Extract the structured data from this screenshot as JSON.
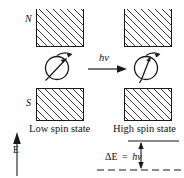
{
  "figure": {
    "stroke_color": "#1a1a1a",
    "hatch_color": "#3a3a3a",
    "background": "#ffffff"
  },
  "labels": {
    "north_pole": "N",
    "south_pole": "S",
    "photon": "hν",
    "low_spin_state": "Low spin state",
    "high_spin_state": "High spin state",
    "energy_axis": "E",
    "delta_e_expression": "ΔE = hν",
    "delta_e_symbol": "ΔE",
    "equals_symbol": "=",
    "delta_e_photon": "hν"
  },
  "boxes": [
    {
      "name": "top-left-magnet-pole",
      "x": 36,
      "y": 9,
      "w": 48,
      "h": 38,
      "pole": "N"
    },
    {
      "name": "top-right-magnet-pole",
      "x": 124,
      "y": 9,
      "w": 48,
      "h": 38,
      "pole": "N"
    },
    {
      "name": "bottom-left-magnet-pole",
      "x": 36,
      "y": 88,
      "w": 48,
      "h": 33,
      "pole": "S"
    },
    {
      "name": "bottom-right-magnet-pole",
      "x": 124,
      "y": 88,
      "w": 48,
      "h": 33,
      "pole": "S"
    }
  ],
  "spins": [
    {
      "name": "low-spin-particle",
      "cx": 57,
      "cy": 68,
      "r": 11,
      "arrow_angle_deg": 35,
      "state": "low"
    },
    {
      "name": "high-spin-particle",
      "cx": 146,
      "cy": 68,
      "r": 11,
      "arrow_angle_deg": 72,
      "state": "high"
    }
  ],
  "energy_levels": {
    "upper_line": {
      "x1": 128,
      "x2": 178,
      "y": 141,
      "style": "solid"
    },
    "lower_line": {
      "x1": 97,
      "x2": 182,
      "y": 170,
      "style": "dashed"
    },
    "gap_arrow": {
      "x": 141,
      "y_top": 142,
      "y_bottom": 169,
      "double_headed": true
    }
  },
  "energy_axis": {
    "x": 17,
    "y_top": 133,
    "y_bottom": 176,
    "direction": "up"
  },
  "transition_arrow": {
    "x1": 88,
    "x2": 126,
    "y": 69,
    "direction": "right"
  }
}
